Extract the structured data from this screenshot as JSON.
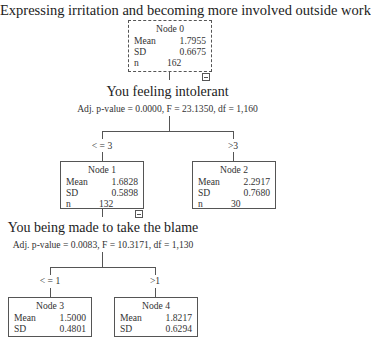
{
  "title": "Expressing irritation and becoming more involved outside work",
  "nodes": {
    "n0": {
      "title": "Node 0",
      "mean_label": "Mean",
      "mean": "1.7955",
      "sd_label": "SD",
      "sd": "0.6675",
      "n_label": "n",
      "n": "162"
    },
    "n1": {
      "title": "Node 1",
      "mean_label": "Mean",
      "mean": "1.6828",
      "sd_label": "SD",
      "sd": "0.5898",
      "n_label": "n",
      "n": "132"
    },
    "n2": {
      "title": "Node 2",
      "mean_label": "Mean",
      "mean": "2.2917",
      "sd_label": "SD",
      "sd": "0.7680",
      "n_label": "n",
      "n": "30"
    },
    "n3": {
      "title": "Node 3",
      "mean_label": "Mean",
      "mean": "1.5000",
      "sd_label": "SD",
      "sd": "0.4801"
    },
    "n4": {
      "title": "Node 4",
      "mean_label": "Mean",
      "mean": "1.8217",
      "sd_label": "SD",
      "sd": "0.6294"
    }
  },
  "splits": {
    "s0": {
      "variable": "You feeling intolerant",
      "stats": "Adj. p-value = 0.0000, F = 23.1350, df = 1,160",
      "left": "< = 3",
      "right": ">3"
    },
    "s1": {
      "variable": "You being made to take the blame",
      "stats": "Adj. p-value = 0.0083, F = 10.3171, df = 1,130",
      "left": "< = 1",
      "right": ">1"
    }
  }
}
